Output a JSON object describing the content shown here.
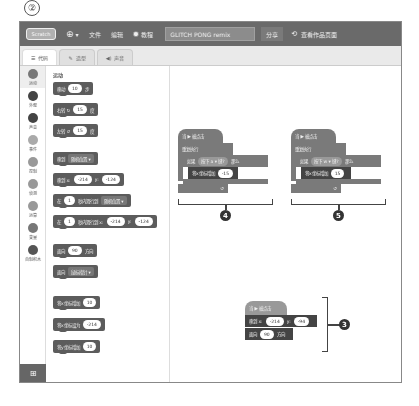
{
  "step_marker": "②",
  "menubar": {
    "logo": "Scratch",
    "globe_icon": "globe-icon",
    "file": "文件",
    "edit": "编辑",
    "tutorial": "教程",
    "project_title": "GLITCH PONG remix",
    "share": "分享",
    "see_project_page": "查看作品页面"
  },
  "tabs": [
    {
      "label": "代码",
      "active": true
    },
    {
      "label": "造型",
      "active": false
    },
    {
      "label": "声音",
      "active": false
    }
  ],
  "categories": [
    {
      "label": "运动",
      "color": "#777777"
    },
    {
      "label": "外观",
      "color": "#444444"
    },
    {
      "label": "声音",
      "color": "#444444"
    },
    {
      "label": "事件",
      "color": "#aaaaaa"
    },
    {
      "label": "控制",
      "color": "#999999"
    },
    {
      "label": "侦测",
      "color": "#999999"
    },
    {
      "label": "运算",
      "color": "#999999"
    },
    {
      "label": "变量",
      "color": "#777777"
    },
    {
      "label": "自制积木",
      "color": "#555555"
    }
  ],
  "palette": {
    "heading": "运动",
    "blocks": [
      {
        "pre": "移动",
        "v1": "10",
        "post": "步"
      },
      {
        "pre": "右转 ↻",
        "v1": "15",
        "post": "度"
      },
      {
        "pre": "左转 ↺",
        "v1": "15",
        "post": "度"
      },
      {
        "pre": "移到",
        "dropdown": "随机位置 ▾"
      },
      {
        "pre": "移到 x:",
        "v1": "-214",
        "mid": "y:",
        "v2": "-124"
      },
      {
        "pre": "在",
        "v1": "1",
        "mid": "秒内滑行到",
        "dropdown": "随机位置 ▾"
      },
      {
        "pre": "在",
        "v1": "1",
        "mid": "秒内滑行到 x:",
        "v2": "-214",
        "mid2": "y:",
        "v3": "-124"
      },
      {
        "pre": "面向",
        "v1": "90",
        "post": "方向"
      },
      {
        "pre": "面向",
        "dropdown": "鼠标指针 ▾"
      },
      {
        "pre": "将x坐标增加",
        "v1": "10"
      },
      {
        "pre": "将x坐标设为",
        "v1": "-214"
      },
      {
        "pre": "将y坐标增加",
        "v1": "10"
      }
    ]
  },
  "scripts": {
    "script_left": {
      "hat": "当 ▶ 被点击",
      "forever": "重复执行",
      "if": "如果",
      "key_a": "按下",
      "key_b": "a ▾",
      "key_c": "键?",
      "then": "那么",
      "change_x": "将x坐标增加",
      "change_value": "-15",
      "label": "4"
    },
    "script_right": {
      "hat": "当 ▶ 被点击",
      "forever": "重复执行",
      "if": "如果",
      "key_a": "按下",
      "key_b": "w ▾",
      "key_c": "键?",
      "then": "那么",
      "change_x": "将x坐标增加",
      "change_value": "15",
      "label": "5"
    },
    "script_bottom": {
      "hat": "当 ▶ 被点击",
      "goto": "移到 x:",
      "x": "-214",
      "y_label": "y:",
      "y": "-94",
      "point": "面向",
      "dir": "90",
      "dir_post": "方向",
      "label": "3"
    }
  }
}
